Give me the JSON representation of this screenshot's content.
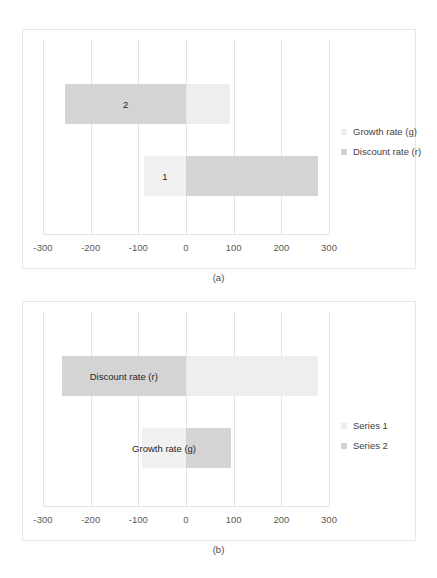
{
  "figure": {
    "panels": [
      {
        "caption": "(a)",
        "legend": [
          {
            "label": "Growth rate (g)",
            "color": "#eeeeee"
          },
          {
            "label": "Discount rate (r)",
            "color": "#d4d4d4"
          }
        ]
      },
      {
        "caption": "(b)",
        "legend": [
          {
            "label": "Series 1",
            "color": "#eeeeee"
          },
          {
            "label": "Series 2",
            "color": "#d4d4d4"
          }
        ]
      }
    ]
  },
  "chart_data": [
    {
      "type": "bar",
      "orientation": "horizontal",
      "stacked": true,
      "title": "",
      "xlabel": "",
      "ylabel": "",
      "xlim": [
        -300,
        300
      ],
      "xticks": [
        -300,
        -200,
        -100,
        0,
        100,
        200,
        300
      ],
      "xticklabels": [
        "-300",
        "-200",
        "-100",
        "0",
        "100",
        "200",
        "300"
      ],
      "grid": true,
      "legend_position": "right",
      "categories": [
        "1",
        "2"
      ],
      "bar_labels": [
        "1",
        "2"
      ],
      "series": [
        {
          "name": "Growth rate (g)",
          "color": "#eeeeee",
          "values": [
            -88,
            92
          ]
        },
        {
          "name": "Discount rate (r)",
          "color": "#d4d4d4",
          "values": [
            277,
            -253
          ]
        }
      ],
      "bars": [
        {
          "label": "2",
          "segments": [
            {
              "series": "Discount rate (r)",
              "from": -253,
              "to": 0,
              "color": "#d4d4d4"
            },
            {
              "series": "Growth rate (g)",
              "from": 0,
              "to": 92,
              "color": "#eeeeee"
            }
          ]
        },
        {
          "label": "1",
          "segments": [
            {
              "series": "Growth rate (g)",
              "from": -88,
              "to": 0,
              "color": "#f1f1f1"
            },
            {
              "series": "Discount rate (r)",
              "from": 0,
              "to": 277,
              "color": "#d4d4d4"
            }
          ]
        }
      ]
    },
    {
      "type": "bar",
      "orientation": "horizontal",
      "stacked": true,
      "title": "",
      "xlabel": "",
      "ylabel": "",
      "xlim": [
        -300,
        300
      ],
      "xticks": [
        -300,
        -200,
        -100,
        0,
        100,
        200,
        300
      ],
      "xticklabels": [
        "-300",
        "-200",
        "-100",
        "0",
        "100",
        "200",
        "300"
      ],
      "grid": true,
      "legend_position": "right",
      "categories": [
        "Discount rate (r)",
        "Growth rate (g)"
      ],
      "bar_labels": [
        "Discount rate (r)",
        "Growth rate (g)"
      ],
      "series": [
        {
          "name": "Series 1",
          "color": "#eeeeee",
          "values": [
            277,
            -92
          ]
        },
        {
          "name": "Series 2",
          "color": "#d4d4d4",
          "values": [
            -261,
            94
          ]
        }
      ],
      "bars": [
        {
          "label": "Discount rate (r)",
          "segments": [
            {
              "series": "Series 2",
              "from": -261,
              "to": 0,
              "color": "#d4d4d4"
            },
            {
              "series": "Series 1",
              "from": 0,
              "to": 277,
              "color": "#eeeeee"
            }
          ]
        },
        {
          "label": "Growth rate (g)",
          "segments": [
            {
              "series": "Series 1",
              "from": -92,
              "to": 0,
              "color": "#f1f1f1"
            },
            {
              "series": "Series 2",
              "from": 0,
              "to": 94,
              "color": "#d4d4d4"
            }
          ]
        }
      ]
    }
  ]
}
